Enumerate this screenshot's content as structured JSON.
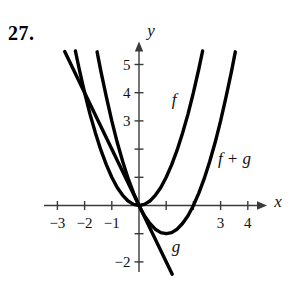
{
  "problem_number": "27.",
  "chart_data": {
    "type": "line",
    "title": "",
    "xlabel": "x",
    "ylabel": "y",
    "xlim": [
      -3.5,
      4.7
    ],
    "ylim": [
      -3.3,
      5.8
    ],
    "grid": false,
    "legend_position": "none (curves labeled inline)",
    "x_ticks": [
      -3,
      -2,
      -1,
      1,
      2,
      3,
      4
    ],
    "y_ticks": [
      5,
      4,
      3,
      2,
      1,
      -1,
      -2
    ],
    "x_tick_labels": [
      {
        "value": -3,
        "label": "−3"
      },
      {
        "value": -2,
        "label": "−2"
      },
      {
        "value": -1,
        "label": "−1"
      },
      {
        "value": 3,
        "label": "3"
      },
      {
        "value": 4,
        "label": "4"
      }
    ],
    "y_tick_labels": [
      {
        "value": 5,
        "label": "5"
      },
      {
        "value": 4,
        "label": "4"
      },
      {
        "value": 3,
        "label": "3"
      },
      {
        "value": -2,
        "label": "−2"
      }
    ],
    "series": [
      {
        "name": "f",
        "label": "f",
        "description": "upward parabola with vertex at origin, f(x)=x^2",
        "points": [
          [
            -2.34,
            5.48
          ],
          [
            -2.2,
            4.84
          ],
          [
            -2.0,
            4.0
          ],
          [
            -1.8,
            3.24
          ],
          [
            -1.6,
            2.56
          ],
          [
            -1.4,
            1.96
          ],
          [
            -1.2,
            1.44
          ],
          [
            -1.0,
            1.0
          ],
          [
            -0.8,
            0.64
          ],
          [
            -0.6,
            0.36
          ],
          [
            -0.4,
            0.16
          ],
          [
            -0.2,
            0.04
          ],
          [
            0,
            0
          ],
          [
            0.2,
            0.04
          ],
          [
            0.4,
            0.16
          ],
          [
            0.6,
            0.36
          ],
          [
            0.8,
            0.64
          ],
          [
            1.0,
            1.0
          ],
          [
            1.2,
            1.44
          ],
          [
            1.4,
            1.96
          ],
          [
            1.6,
            2.56
          ],
          [
            1.8,
            3.24
          ],
          [
            2.0,
            4.0
          ],
          [
            2.2,
            4.84
          ],
          [
            2.34,
            5.48
          ]
        ]
      },
      {
        "name": "f+g",
        "label": "f + g",
        "description": "upward parabola through (0,0) and (2,0), vertex (1,-1)",
        "points": [
          [
            -1.54,
            5.45
          ],
          [
            -1.4,
            4.76
          ],
          [
            -1.2,
            3.84
          ],
          [
            -1.0,
            3.0
          ],
          [
            -0.8,
            2.24
          ],
          [
            -0.6,
            1.56
          ],
          [
            -0.4,
            0.96
          ],
          [
            -0.2,
            0.44
          ],
          [
            0,
            0
          ],
          [
            0.2,
            -0.36
          ],
          [
            0.4,
            -0.64
          ],
          [
            0.6,
            -0.84
          ],
          [
            0.8,
            -0.96
          ],
          [
            1.0,
            -1.0
          ],
          [
            1.2,
            -0.96
          ],
          [
            1.4,
            -0.84
          ],
          [
            1.6,
            -0.64
          ],
          [
            1.8,
            -0.36
          ],
          [
            2.0,
            0
          ],
          [
            2.2,
            0.44
          ],
          [
            2.4,
            0.96
          ],
          [
            2.6,
            1.56
          ],
          [
            2.8,
            2.24
          ],
          [
            3.0,
            3.0
          ],
          [
            3.2,
            3.84
          ],
          [
            3.4,
            4.76
          ],
          [
            3.54,
            5.45
          ]
        ]
      },
      {
        "name": "g",
        "label": "g",
        "description": "straight line through origin, slope -2",
        "points": [
          [
            -2.73,
            5.46
          ],
          [
            1.22,
            -2.44
          ]
        ]
      }
    ],
    "annotations": [
      {
        "text": "f",
        "x": 1.29,
        "y": 3.78
      },
      {
        "text": "f + g",
        "x": 3.51,
        "y": 1.68
      },
      {
        "text": "g",
        "x": 1.36,
        "y": -1.45
      }
    ]
  }
}
